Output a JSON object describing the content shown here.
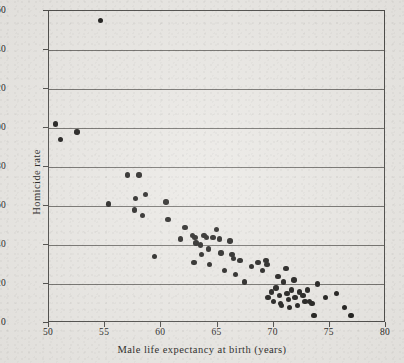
{
  "chart_data": {
    "type": "scatter",
    "title": "",
    "xlabel": "Male life expectancy at birth (years)",
    "ylabel": "Homicide rate",
    "xlim": [
      50,
      80
    ],
    "ylim": [
      0,
      160
    ],
    "xticks": [
      50,
      55,
      60,
      65,
      70,
      75,
      80
    ],
    "xticklabels": [
      "50",
      "55",
      "60",
      "65",
      "70",
      "75",
      "80"
    ],
    "yticks": [
      0,
      20,
      40,
      60,
      80,
      100,
      120,
      140,
      160
    ],
    "yticklabels": [
      "0",
      "20",
      "40",
      "60",
      "80",
      "100",
      "120",
      "140",
      "160"
    ],
    "grid": "horizontal",
    "legend": "none",
    "marker": "filled-circle",
    "marker_color": "#191816",
    "background_color": "#e9e7e3",
    "gridline_color": "#6e6c68",
    "axis_color": "#4b4a47",
    "n_points": 71,
    "points": [
      {
        "x": 50.6,
        "y": 102
      },
      {
        "x": 51.0,
        "y": 94
      },
      {
        "x": 52.5,
        "y": 98
      },
      {
        "x": 54.6,
        "y": 155
      },
      {
        "x": 55.3,
        "y": 61
      },
      {
        "x": 57.0,
        "y": 76
      },
      {
        "x": 57.7,
        "y": 64
      },
      {
        "x": 57.6,
        "y": 58
      },
      {
        "x": 58.0,
        "y": 76
      },
      {
        "x": 58.3,
        "y": 55
      },
      {
        "x": 58.6,
        "y": 66
      },
      {
        "x": 59.4,
        "y": 34
      },
      {
        "x": 60.4,
        "y": 62
      },
      {
        "x": 60.6,
        "y": 53
      },
      {
        "x": 61.7,
        "y": 43
      },
      {
        "x": 62.1,
        "y": 49
      },
      {
        "x": 62.8,
        "y": 45
      },
      {
        "x": 63.0,
        "y": 44
      },
      {
        "x": 63.1,
        "y": 41
      },
      {
        "x": 62.9,
        "y": 31
      },
      {
        "x": 63.5,
        "y": 40
      },
      {
        "x": 63.6,
        "y": 35
      },
      {
        "x": 63.8,
        "y": 45
      },
      {
        "x": 64.0,
        "y": 44
      },
      {
        "x": 64.2,
        "y": 38
      },
      {
        "x": 64.3,
        "y": 30
      },
      {
        "x": 64.6,
        "y": 44
      },
      {
        "x": 64.9,
        "y": 48
      },
      {
        "x": 65.2,
        "y": 43
      },
      {
        "x": 65.3,
        "y": 36
      },
      {
        "x": 65.6,
        "y": 27
      },
      {
        "x": 66.1,
        "y": 42
      },
      {
        "x": 66.3,
        "y": 35
      },
      {
        "x": 66.4,
        "y": 33
      },
      {
        "x": 66.6,
        "y": 25
      },
      {
        "x": 67.0,
        "y": 32
      },
      {
        "x": 67.4,
        "y": 21
      },
      {
        "x": 68.0,
        "y": 29
      },
      {
        "x": 68.6,
        "y": 31
      },
      {
        "x": 69.0,
        "y": 27
      },
      {
        "x": 69.3,
        "y": 32
      },
      {
        "x": 69.4,
        "y": 30
      },
      {
        "x": 69.5,
        "y": 13
      },
      {
        "x": 69.8,
        "y": 16
      },
      {
        "x": 70.0,
        "y": 11
      },
      {
        "x": 70.2,
        "y": 18
      },
      {
        "x": 70.4,
        "y": 24
      },
      {
        "x": 70.5,
        "y": 14
      },
      {
        "x": 70.6,
        "y": 10
      },
      {
        "x": 70.7,
        "y": 9
      },
      {
        "x": 70.9,
        "y": 21
      },
      {
        "x": 71.1,
        "y": 28
      },
      {
        "x": 71.2,
        "y": 15
      },
      {
        "x": 71.3,
        "y": 12
      },
      {
        "x": 71.4,
        "y": 8
      },
      {
        "x": 71.6,
        "y": 17
      },
      {
        "x": 71.8,
        "y": 22
      },
      {
        "x": 71.9,
        "y": 13
      },
      {
        "x": 72.1,
        "y": 9
      },
      {
        "x": 72.3,
        "y": 16
      },
      {
        "x": 72.6,
        "y": 14
      },
      {
        "x": 72.8,
        "y": 11
      },
      {
        "x": 73.0,
        "y": 17
      },
      {
        "x": 73.2,
        "y": 11
      },
      {
        "x": 73.4,
        "y": 10
      },
      {
        "x": 73.6,
        "y": 4
      },
      {
        "x": 73.9,
        "y": 20
      },
      {
        "x": 74.6,
        "y": 13
      },
      {
        "x": 75.6,
        "y": 15
      },
      {
        "x": 76.3,
        "y": 8
      },
      {
        "x": 76.9,
        "y": 4
      }
    ]
  }
}
